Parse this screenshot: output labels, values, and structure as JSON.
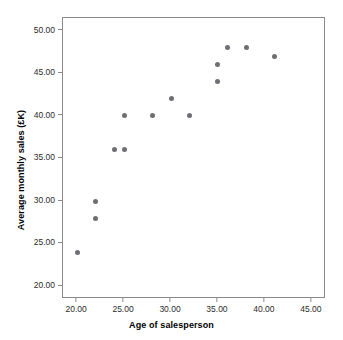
{
  "chart_data": {
    "type": "scatter",
    "title": "",
    "xlabel": "Age of salesperson",
    "ylabel": "Average monthly sales (£K)",
    "xlim": [
      18.5,
      46.5
    ],
    "ylim": [
      18.5,
      51.5
    ],
    "xticks": [
      20,
      25,
      30,
      35,
      40,
      45
    ],
    "yticks": [
      20,
      25,
      30,
      35,
      40,
      45,
      50
    ],
    "xtick_labels": [
      "20.00",
      "25.00",
      "30.00",
      "35.00",
      "40.00",
      "45.00"
    ],
    "ytick_labels": [
      "20.00",
      "25.00",
      "30.00",
      "35.00",
      "40.00",
      "45.00",
      "50.00"
    ],
    "grid": false,
    "legend": false,
    "marker_color": "#6e6e73",
    "frame_color": "#8a8a8a",
    "x": [
      20,
      22,
      22,
      24,
      25,
      25,
      28,
      30,
      32,
      35,
      35,
      36,
      38,
      41
    ],
    "y": [
      24,
      28,
      30,
      36,
      36,
      40,
      40,
      42,
      40,
      44,
      46,
      48,
      48,
      47
    ],
    "points": [
      {
        "x": 20,
        "y": 24
      },
      {
        "x": 22,
        "y": 28
      },
      {
        "x": 22,
        "y": 30
      },
      {
        "x": 24,
        "y": 36
      },
      {
        "x": 25,
        "y": 36
      },
      {
        "x": 25,
        "y": 40
      },
      {
        "x": 28,
        "y": 40
      },
      {
        "x": 30,
        "y": 42
      },
      {
        "x": 32,
        "y": 40
      },
      {
        "x": 35,
        "y": 44
      },
      {
        "x": 35,
        "y": 46
      },
      {
        "x": 36,
        "y": 48
      },
      {
        "x": 38,
        "y": 48
      },
      {
        "x": 41,
        "y": 47
      }
    ]
  }
}
